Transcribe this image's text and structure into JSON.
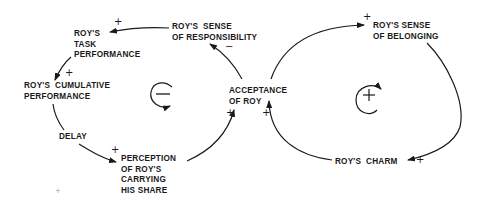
{
  "diagram": {
    "type": "causal-loop",
    "nodes": {
      "task_performance": "ROY'S\nTASK\nPERFORMANCE",
      "sense_of_responsibility": "ROY'S  SENSE\nOF RESPONSIBILITY",
      "cumulative_performance": "ROY'S  CUMULATIVE\nPERFORMANCE",
      "delay": "DELAY",
      "perception": "PERCEPTION\nOF ROY'S\nCARRYING\nHIS SHARE",
      "acceptance": "ACCEPTANCE\nOF ROY",
      "sense_of_belonging": "ROY'S SENSE\nOF BELONGING",
      "charm": "ROY'S  CHARM"
    },
    "polarities": {
      "responsibility_to_task": "+",
      "task_to_cumulative": "+",
      "delay_to_perception": "+",
      "perception_to_acceptance": "+",
      "acceptance_to_responsibility": "−",
      "charm_to_acceptance": "+",
      "acceptance_to_belonging": "+",
      "belonging_to_charm": "+"
    },
    "loops": {
      "left": "−",
      "right": "+"
    },
    "stray_mark": "+"
  }
}
